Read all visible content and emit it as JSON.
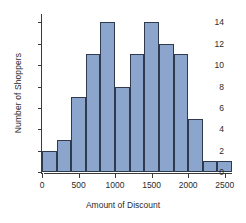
{
  "chart_data": {
    "type": "bar",
    "title": "",
    "subtitle": "",
    "xlabel": "Amount of Discount",
    "ylabel": "Number of Shoppers",
    "xlim": [
      0,
      2600
    ],
    "ylim": [
      0,
      14.6
    ],
    "bin_width": 200,
    "grid": false,
    "legend": null,
    "bar_color": "#8ba5cd",
    "bar_edge_color": "#2f3a4e",
    "axis_color": "#3a3a3a",
    "xticks": [
      0,
      500,
      1000,
      1500,
      2000,
      2500
    ],
    "xtick_labels": [
      "0",
      "500",
      "1000",
      "1500",
      "2000",
      "2500"
    ],
    "yticks": [
      0,
      2,
      4,
      6,
      8,
      10,
      12,
      14
    ],
    "ytick_labels": [
      "0",
      "2",
      "4",
      "6",
      "8",
      "10",
      "12",
      "14"
    ],
    "bins": [
      {
        "x0": 0,
        "x1": 200,
        "value": 2
      },
      {
        "x0": 200,
        "x1": 400,
        "value": 3
      },
      {
        "x0": 400,
        "x1": 600,
        "value": 7
      },
      {
        "x0": 600,
        "x1": 800,
        "value": 11
      },
      {
        "x0": 800,
        "x1": 1000,
        "value": 14
      },
      {
        "x0": 1000,
        "x1": 1200,
        "value": 8
      },
      {
        "x0": 1200,
        "x1": 1400,
        "value": 11
      },
      {
        "x0": 1400,
        "x1": 1600,
        "value": 14
      },
      {
        "x0": 1600,
        "x1": 1800,
        "value": 12
      },
      {
        "x0": 1800,
        "x1": 2000,
        "value": 11
      },
      {
        "x0": 2000,
        "x1": 2200,
        "value": 5
      },
      {
        "x0": 2200,
        "x1": 2400,
        "value": 1
      },
      {
        "x0": 2400,
        "x1": 2600,
        "value": 1
      }
    ],
    "categories": [
      "0-200",
      "200-400",
      "400-600",
      "600-800",
      "800-1000",
      "1000-1200",
      "1200-1400",
      "1400-1600",
      "1600-1800",
      "1800-2000",
      "2000-2200",
      "2200-2400",
      "2400-2600"
    ],
    "values": [
      2,
      3,
      7,
      11,
      14,
      8,
      11,
      14,
      12,
      11,
      5,
      1,
      1
    ]
  }
}
